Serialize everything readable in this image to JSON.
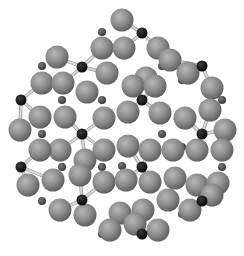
{
  "figure": {
    "type": "ball-and-stick atomic cluster",
    "width": 244,
    "height": 256,
    "background": "#ffffff"
  },
  "colors": {
    "large_atom": "#8a8a8a",
    "large_atom_highlight": "#b4b4b4",
    "large_atom_shadow": "#5e5e5e",
    "small_atom": "#4a4a4a",
    "black_atom": "#111111",
    "bond": "#d8d8d8",
    "bond_edge": "#9a9a9a"
  },
  "radii": {
    "large": 11.5,
    "small": 4,
    "black": 5.5
  },
  "atoms": {
    "black": [
      [
        142,
        33
      ],
      [
        82,
        67
      ],
      [
        202,
        66
      ],
      [
        21,
        100
      ],
      [
        142,
        100
      ],
      [
        82,
        134
      ],
      [
        202,
        134
      ],
      [
        21,
        167
      ],
      [
        142,
        167
      ],
      [
        82,
        200
      ],
      [
        202,
        201
      ],
      [
        142,
        234
      ]
    ],
    "small": [
      [
        102,
        32
      ],
      [
        42,
        66
      ],
      [
        162,
        66
      ],
      [
        102,
        100
      ],
      [
        222,
        100
      ],
      [
        62,
        100
      ],
      [
        182,
        80
      ],
      [
        42,
        134
      ],
      [
        162,
        134
      ],
      [
        102,
        167
      ],
      [
        222,
        167
      ],
      [
        62,
        167
      ],
      [
        182,
        147
      ],
      [
        42,
        201
      ],
      [
        162,
        201
      ],
      [
        102,
        234
      ],
      [
        122,
        166
      ],
      [
        182,
        214
      ]
    ],
    "large": [
      [
        122,
        20
      ],
      [
        102,
        48
      ],
      [
        124,
        48
      ],
      [
        158,
        48
      ],
      [
        57,
        57
      ],
      [
        170,
        60
      ],
      [
        42,
        83
      ],
      [
        63,
        83
      ],
      [
        87,
        92
      ],
      [
        107,
        73
      ],
      [
        146,
        78
      ],
      [
        188,
        73
      ],
      [
        212,
        88
      ],
      [
        133,
        86
      ],
      [
        155,
        86
      ],
      [
        40,
        117
      ],
      [
        65,
        117
      ],
      [
        104,
        118
      ],
      [
        128,
        112
      ],
      [
        160,
        113
      ],
      [
        185,
        118
      ],
      [
        210,
        110
      ],
      [
        225,
        130
      ],
      [
        20,
        130
      ],
      [
        60,
        150
      ],
      [
        40,
        150
      ],
      [
        85,
        160
      ],
      [
        104,
        150
      ],
      [
        128,
        146
      ],
      [
        150,
        150
      ],
      [
        173,
        150
      ],
      [
        197,
        150
      ],
      [
        222,
        150
      ],
      [
        28,
        185
      ],
      [
        53,
        180
      ],
      [
        80,
        175
      ],
      [
        104,
        182
      ],
      [
        126,
        180
      ],
      [
        150,
        182
      ],
      [
        175,
        178
      ],
      [
        197,
        185
      ],
      [
        218,
        183
      ],
      [
        60,
        210
      ],
      [
        85,
        215
      ],
      [
        120,
        213
      ],
      [
        143,
        210
      ],
      [
        168,
        200
      ],
      [
        110,
        230
      ],
      [
        135,
        224
      ],
      [
        158,
        230
      ],
      [
        190,
        210
      ],
      [
        212,
        195
      ]
    ]
  },
  "bonds": [
    [
      [
        82,
        67
      ],
      [
        57,
        57
      ]
    ],
    [
      [
        82,
        67
      ],
      [
        102,
        48
      ]
    ],
    [
      [
        82,
        67
      ],
      [
        63,
        83
      ]
    ],
    [
      [
        82,
        67
      ],
      [
        107,
        73
      ]
    ],
    [
      [
        142,
        33
      ],
      [
        122,
        20
      ]
    ],
    [
      [
        142,
        33
      ],
      [
        124,
        48
      ]
    ],
    [
      [
        142,
        33
      ],
      [
        158,
        48
      ]
    ],
    [
      [
        202,
        66
      ],
      [
        170,
        60
      ]
    ],
    [
      [
        202,
        66
      ],
      [
        188,
        73
      ]
    ],
    [
      [
        202,
        66
      ],
      [
        212,
        88
      ]
    ],
    [
      [
        21,
        100
      ],
      [
        42,
        83
      ]
    ],
    [
      [
        21,
        100
      ],
      [
        20,
        130
      ]
    ],
    [
      [
        21,
        100
      ],
      [
        40,
        117
      ]
    ],
    [
      [
        142,
        100
      ],
      [
        133,
        86
      ]
    ],
    [
      [
        142,
        100
      ],
      [
        155,
        86
      ]
    ],
    [
      [
        142,
        100
      ],
      [
        128,
        112
      ]
    ],
    [
      [
        142,
        100
      ],
      [
        160,
        113
      ]
    ],
    [
      [
        82,
        134
      ],
      [
        65,
        117
      ]
    ],
    [
      [
        82,
        134
      ],
      [
        104,
        118
      ]
    ],
    [
      [
        82,
        134
      ],
      [
        60,
        150
      ]
    ],
    [
      [
        82,
        134
      ],
      [
        104,
        150
      ]
    ],
    [
      [
        82,
        134
      ],
      [
        85,
        160
      ]
    ],
    [
      [
        202,
        134
      ],
      [
        185,
        118
      ]
    ],
    [
      [
        202,
        134
      ],
      [
        210,
        110
      ]
    ],
    [
      [
        202,
        134
      ],
      [
        197,
        150
      ]
    ],
    [
      [
        202,
        134
      ],
      [
        225,
        130
      ]
    ],
    [
      [
        21,
        167
      ],
      [
        40,
        150
      ]
    ],
    [
      [
        21,
        167
      ],
      [
        28,
        185
      ]
    ],
    [
      [
        21,
        167
      ],
      [
        53,
        180
      ]
    ],
    [
      [
        142,
        167
      ],
      [
        128,
        146
      ]
    ],
    [
      [
        142,
        167
      ],
      [
        150,
        150
      ]
    ],
    [
      [
        142,
        167
      ],
      [
        126,
        180
      ]
    ],
    [
      [
        142,
        167
      ],
      [
        150,
        182
      ]
    ],
    [
      [
        82,
        200
      ],
      [
        80,
        175
      ]
    ],
    [
      [
        82,
        200
      ],
      [
        60,
        210
      ]
    ],
    [
      [
        82,
        200
      ],
      [
        104,
        182
      ]
    ],
    [
      [
        82,
        200
      ],
      [
        85,
        215
      ]
    ],
    [
      [
        202,
        201
      ],
      [
        197,
        185
      ]
    ],
    [
      [
        202,
        201
      ],
      [
        218,
        183
      ]
    ],
    [
      [
        202,
        201
      ],
      [
        190,
        210
      ]
    ],
    [
      [
        142,
        234
      ],
      [
        135,
        224
      ]
    ],
    [
      [
        142,
        234
      ],
      [
        158,
        230
      ]
    ],
    [
      [
        142,
        234
      ],
      [
        120,
        213
      ]
    ]
  ]
}
